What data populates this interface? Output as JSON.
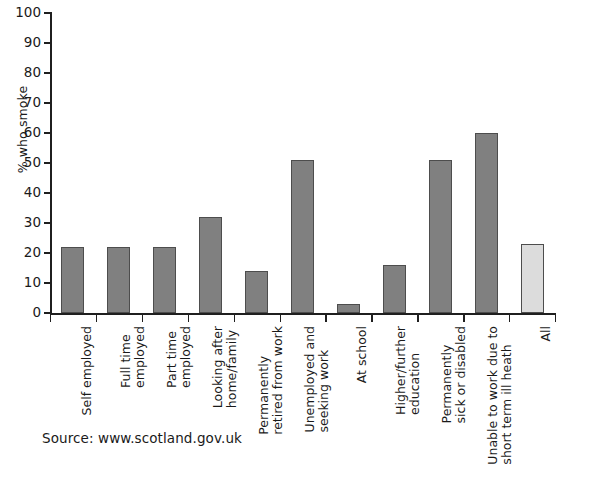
{
  "chart_data": {
    "type": "bar",
    "title": "",
    "subtitle": "",
    "xlabel": "",
    "ylabel": "% who smoke",
    "ylim": [
      0,
      100
    ],
    "ytick_step": 10,
    "grid": false,
    "legend": "none",
    "source": "Source: www.scotland.gov.uk",
    "ytick_labels": [
      "100",
      "90",
      "80",
      "70",
      "60",
      "50",
      "40",
      "30",
      "20",
      "10",
      "0"
    ],
    "categories": [
      "Self employed",
      "Full time employed",
      "Part time employed",
      "Looking after home/family",
      "Permanently retired from work",
      "Unemployed and seeking work",
      "At school",
      "Higher/further education",
      "Permanently sick or disabled",
      "Unable to work due to short term ill heath",
      "All"
    ],
    "category_label_lines": [
      [
        "Self employed"
      ],
      [
        "Full time",
        "employed"
      ],
      [
        "Part time",
        "employed"
      ],
      [
        "Looking after",
        "home/family"
      ],
      [
        "Permanently",
        "retired from work"
      ],
      [
        "Unemployed and",
        "seeking work"
      ],
      [
        "At school"
      ],
      [
        "Higher/further",
        "education"
      ],
      [
        "Permanently",
        "sick or disabled"
      ],
      [
        "Unable to work due to",
        "short term ill heath"
      ],
      [
        "All"
      ]
    ],
    "values": [
      22,
      22,
      22,
      32,
      14,
      51,
      3,
      16,
      51,
      60,
      23
    ],
    "bar_colors": [
      "#808080",
      "#808080",
      "#808080",
      "#808080",
      "#808080",
      "#808080",
      "#808080",
      "#808080",
      "#808080",
      "#808080",
      "#dcdcdc"
    ],
    "bar_border_color": "#4d4d4d",
    "axis_color": "#1f1f1f",
    "background_color": "#ffffff"
  }
}
